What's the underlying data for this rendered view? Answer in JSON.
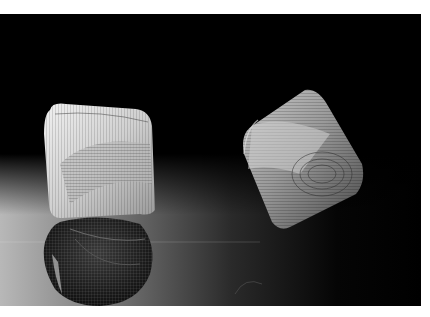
{
  "image": {
    "alt": "Photograph of two wire-mesh cube sculptures on a black background with reflective floor",
    "subjects": [
      {
        "name": "left-mesh-sculpture",
        "description": "bright rounded cube of woven wire mesh"
      },
      {
        "name": "left-sculpture-reflection",
        "description": "dark mirrored reflection of the left sculpture"
      },
      {
        "name": "right-mesh-sculpture",
        "description": "tilted cube of wire mesh with swirling contour lines"
      }
    ],
    "colors": {
      "background": "#000000",
      "margin": "#ffffff",
      "mesh_light": "#d8d8d8",
      "mesh_mid": "#8a8a8a",
      "floor_grey": "#9a9a9a"
    }
  }
}
